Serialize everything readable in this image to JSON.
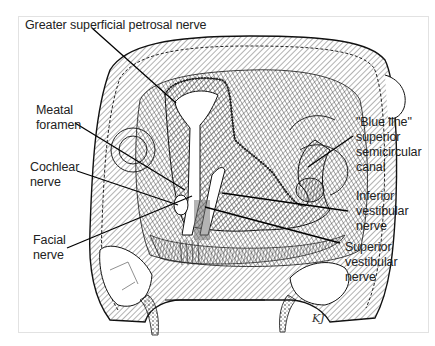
{
  "figure": {
    "labels": {
      "gspn": "Greater superficial petrosal nerve",
      "meatal_foramen": "Meatal\nforamen",
      "cochlear_nerve": "Cochlear\nnerve",
      "facial_nerve": "Facial\nnerve",
      "blue_line": "\"Blue line\"\nsuperior\nsemicircular\ncanal",
      "inferior_vestibular": "Inferior\nvestibular\nnerve",
      "superior_vestibular": "Superior\nvestibular\nnerve"
    },
    "signature": "KJ"
  }
}
